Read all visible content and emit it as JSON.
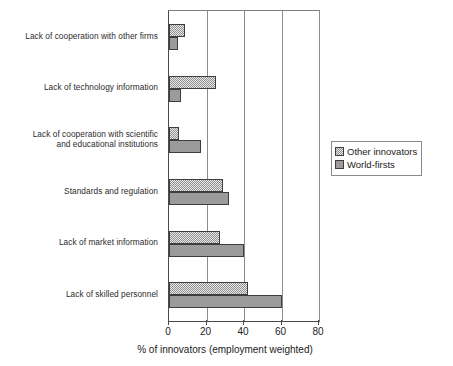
{
  "chart_data": {
    "type": "bar",
    "orientation": "horizontal",
    "title": "",
    "subtitle": "",
    "xlabel": "% of innovators (employment weighted)",
    "ylabel": "",
    "xlim": [
      0,
      80
    ],
    "xticks": [
      0,
      20,
      40,
      60,
      80
    ],
    "xtick_labels": [
      "0",
      "20",
      "40",
      "60",
      "80"
    ],
    "grid": "vertical-gridlines-at-xticks",
    "legend_position": "right-middle-outside",
    "categories": [
      "Lack of cooperation with other firms",
      "Lack of technology information",
      "Lack of cooperation with scientific and educational institutions",
      "Standards and regulation",
      "Lack of market information",
      "Lack of skilled personnel"
    ],
    "category_labels": [
      [
        "Lack of cooperation with other firms"
      ],
      [
        "Lack of technology information"
      ],
      [
        "Lack of cooperation with scientific",
        "and educational institutions"
      ],
      [
        "Standards and regulation"
      ],
      [
        "Lack of market information"
      ],
      [
        "Lack of skilled personnel"
      ]
    ],
    "series": [
      {
        "name": "Other innovators",
        "pattern": "checkerboard-hatch",
        "color": "#c9c9c9",
        "values": [
          8.5,
          25,
          5.5,
          29,
          27,
          42
        ]
      },
      {
        "name": "World-firsts",
        "pattern": "solid",
        "color": "#9b9b9b",
        "values": [
          5,
          6.5,
          17,
          32,
          40,
          60
        ]
      }
    ]
  },
  "legend": {
    "items": [
      {
        "label": "Other innovators"
      },
      {
        "label": "World-firsts"
      }
    ]
  },
  "axis": {
    "x_title": "% of innovators (employment weighted)"
  }
}
